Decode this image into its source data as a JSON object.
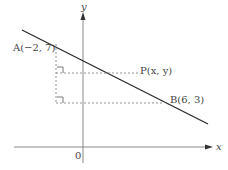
{
  "diagram": {
    "axes": {
      "x_label": "x",
      "y_label": "y",
      "origin_label": "0"
    },
    "points": {
      "A": {
        "label": "A(−2, 7)",
        "x": -2,
        "y": 7
      },
      "P": {
        "label": "P(x, y)"
      },
      "B": {
        "label": "B(6, 3)",
        "x": 6,
        "y": 3
      }
    },
    "colors": {
      "line": "#2a2a2a",
      "axis": "#8a8a8a",
      "dotted": "#7a7a7a",
      "text": "#444444"
    }
  }
}
